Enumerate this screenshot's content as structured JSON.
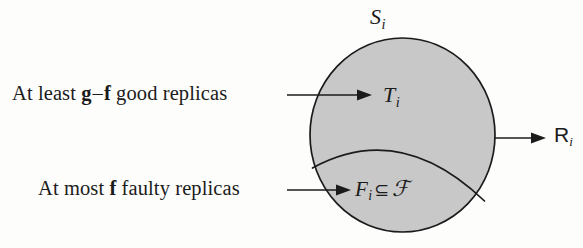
{
  "figure": {
    "name": "quorum-set-venn-diagram",
    "background_color": "#fdfdfc",
    "shape_fill_color": "#c8c8c8",
    "stroke_color": "#1b1b1b",
    "text_color": "#1b1b1b"
  },
  "annotations": {
    "good_replicas": {
      "prefix": "At least ",
      "bold_first": "g",
      "dash": "–",
      "bold_second": "f",
      "suffix": " good replicas"
    },
    "faulty_replicas": {
      "prefix": "At most ",
      "bold_first": "f",
      "suffix": " faulty replicas"
    }
  },
  "set_labels": {
    "outer_set": {
      "symbol": "S",
      "subscript": "i"
    },
    "good_subset": {
      "symbol": "T",
      "subscript": "i"
    },
    "faulty_subset": {
      "symbol": "F",
      "subscript": "i",
      "operator": "⊆",
      "universe": "ℱ"
    },
    "quorum": {
      "symbol": "R",
      "subscript": "i"
    }
  },
  "icons": {
    "arrow_good": "arrow-right-icon",
    "arrow_faulty": "arrow-right-icon",
    "arrow_quorum": "arrow-right-icon"
  }
}
